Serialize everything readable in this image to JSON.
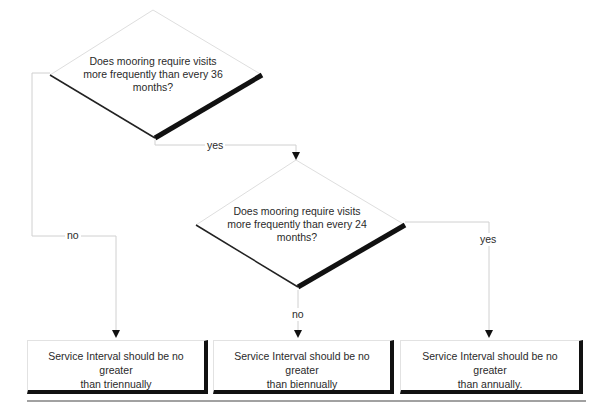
{
  "decisions": [
    {
      "id": "d1",
      "line1": "Does mooring require visits",
      "line2": "more frequently than every 36",
      "line3": "months?"
    },
    {
      "id": "d2",
      "line1": "Does mooring require visits",
      "line2": "more frequently than every 24",
      "line3": "months?"
    }
  ],
  "edge_labels": {
    "d1_yes": "yes",
    "d1_no": "no",
    "d2_yes": "yes",
    "d2_no": "no"
  },
  "outcomes": [
    {
      "line1": "Service Interval should be no greater",
      "line2": "than triennually"
    },
    {
      "line1": "Service Interval should be no greater",
      "line2": "than biennually"
    },
    {
      "line1": "Service Interval should be no greater",
      "line2": "than annually."
    }
  ],
  "colors": {
    "line": "#d0d0d0",
    "shadow": "#111111",
    "text": "#2a2a2a"
  }
}
